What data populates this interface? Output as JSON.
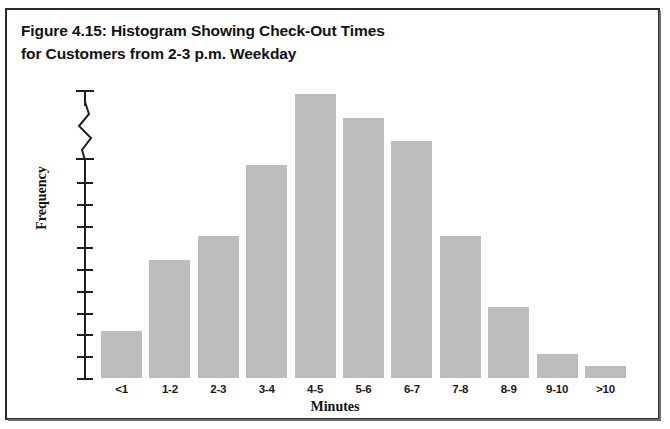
{
  "figure": {
    "border_color": "#2a2a2a",
    "background": "#ffffff",
    "title_line_1": "Figure 4.15: Histogram Showing Check-Out Times",
    "title_line_2": "for Customers from 2-3 p.m. Weekday"
  },
  "chart_data": {
    "type": "bar",
    "title": "Figure 4.15: Histogram Showing Check-Out Times for Customers from 2-3 p.m. Weekday",
    "xlabel": "Minutes",
    "ylabel": "Frequency",
    "categories": [
      "<1",
      "1-2",
      "2-3",
      "3-4",
      "4-5",
      "5-6",
      "6-7",
      "7-8",
      "8-9",
      "9-10",
      ">10"
    ],
    "values": [
      2,
      5,
      6,
      9,
      12,
      11,
      10,
      6,
      3,
      1,
      0.5
    ],
    "bar_color": "#bdbdbd",
    "grid": false,
    "legend": false,
    "y_axis_break": true,
    "y_tick_count": 10,
    "y_tick_labels": [],
    "ylim": [
      0,
      13
    ]
  },
  "axes": {
    "y_axis_label": "Frequency",
    "x_axis_label": "Minutes",
    "break_icon": "zigzag-axis-break-icon"
  }
}
